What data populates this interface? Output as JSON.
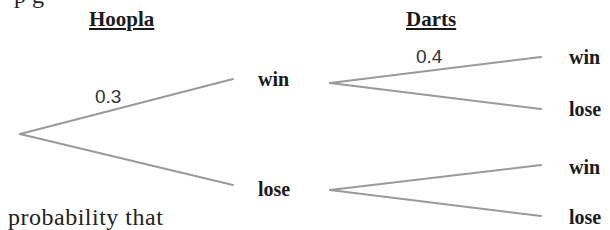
{
  "top_cut_text": "p                    g",
  "headers": {
    "stage1": "Hoopla",
    "stage2": "Darts"
  },
  "tree": {
    "line_color": "#9a9a9a",
    "root": {
      "branches": [
        {
          "label": "win",
          "probability": "0.3",
          "branches": [
            {
              "label": "win",
              "probability": "0.4"
            },
            {
              "label": "lose",
              "probability": ""
            }
          ]
        },
        {
          "label": "lose",
          "probability": "",
          "branches": [
            {
              "label": "win",
              "probability": ""
            },
            {
              "label": "lose",
              "probability": ""
            }
          ]
        }
      ]
    }
  },
  "caption": "probability that"
}
